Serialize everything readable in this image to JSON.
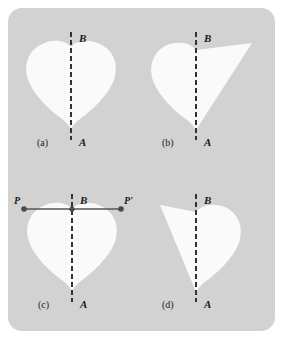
{
  "figure": {
    "caption_labels": [
      "(a)",
      "(b)",
      "(c)",
      "(d)"
    ],
    "axis_top_label": "B",
    "axis_bottom_label": "A",
    "point_left_label": "P",
    "point_right_label": "P'",
    "colors": {
      "page_background": "#ffffff",
      "panel_background": "#d2d2d2",
      "shape_fill": "#fafafa",
      "axis_line": "#333333",
      "segment_line": "#555555",
      "point_dot": "#4a4a4a",
      "label_text": "#1a1a1a"
    }
  },
  "panels": [
    {
      "id": "panel-a",
      "caption": "(a)",
      "axis_top": "B",
      "axis_bottom": "A",
      "shape": "symmetric-heart",
      "has_segment": false
    },
    {
      "id": "panel-b",
      "caption": "(b)",
      "axis_top": "B",
      "axis_bottom": "A",
      "shape": "heart-left-half-with-right-triangular-wing",
      "has_segment": false
    },
    {
      "id": "panel-c",
      "caption": "(c)",
      "axis_top": "B",
      "axis_bottom": "A",
      "shape": "symmetric-heart",
      "has_segment": true,
      "segment_left_point": "P",
      "segment_right_point": "P'"
    },
    {
      "id": "panel-d",
      "caption": "(d)",
      "axis_top": "B",
      "axis_bottom": "A",
      "shape": "heart-right-half-with-left-triangular-wing",
      "has_segment": false
    }
  ]
}
